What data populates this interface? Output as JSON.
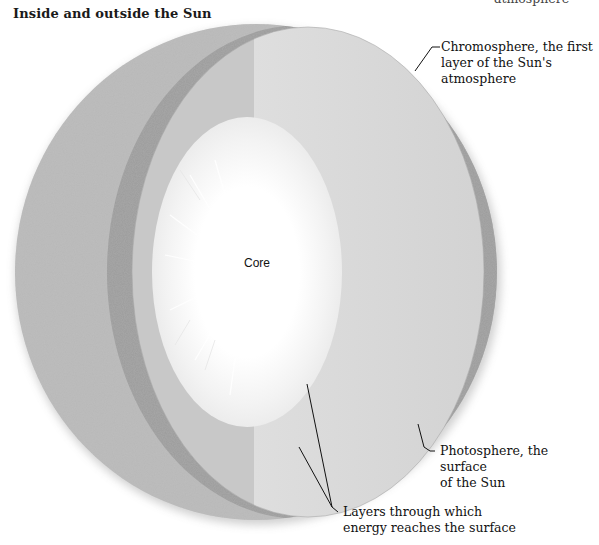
{
  "title": "Inside and outside the Sun",
  "top_fragment": "atmosphere",
  "diagram": {
    "colors": {
      "background": "#ffffff",
      "mottled_surface": "#b8b8b8",
      "chromosphere_band": "#9e9e9e",
      "cut_face_left": "#c6c6c6",
      "cut_face_right": "#d9d9d9",
      "core": "#ffffff",
      "leader_line": "#111111"
    }
  },
  "labels": {
    "core": "Core",
    "chromosphere": [
      "Chromosphere, the first",
      "layer of the Sun's",
      "atmosphere"
    ],
    "photosphere": [
      "Photosphere, the surface",
      "of the Sun"
    ],
    "layers": [
      "Layers through which",
      "energy reaches the surface"
    ]
  }
}
